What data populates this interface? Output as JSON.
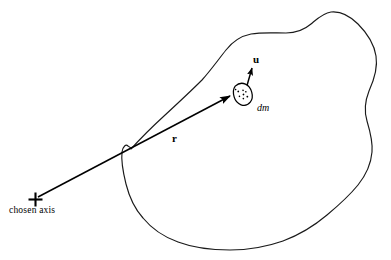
{
  "figure": {
    "kind": "physics-diagram",
    "background_color": "#ffffff",
    "stroke_color": "#1a1a1a",
    "vector_color": "#000000"
  },
  "labels": {
    "chosen_axis": "chosen axis",
    "r_vector": "r",
    "u_vector": "u",
    "mass_element": "dm"
  },
  "geometry": {
    "axis_marker": {
      "x": 35,
      "y": 199
    },
    "mass_element": {
      "x": 243,
      "y": 94,
      "rx": 9,
      "ry": 11,
      "rotation": -28
    },
    "r_vector": {
      "x1": 37,
      "y1": 197,
      "x2": 232,
      "y2": 96
    },
    "u_vector": {
      "x1": 247,
      "y1": 88,
      "x2": 252,
      "y2": 66
    },
    "body_outline_points": "131,149 150,128 175,105 200,80 218,58 232,44 248,36 266,33 286,33 305,27 322,14 340,12 355,20 367,34 375,52 377,72 370,92 366,112 371,130 372,150 365,170 352,186 336,203 317,220 295,234 270,244 244,249 218,249 194,245 172,236 155,223 142,207 133,190 126,174 122,161"
  },
  "mass_element_dots": [
    {
      "cx": -3.0,
      "cy": -4.5,
      "r": 0.9
    },
    {
      "cx": 1.8,
      "cy": -3.2,
      "r": 0.8
    },
    {
      "cx": -4.2,
      "cy": 0.4,
      "r": 0.8
    },
    {
      "cx": 0.2,
      "cy": 0.6,
      "r": 0.9
    },
    {
      "cx": 3.6,
      "cy": -0.6,
      "r": 0.8
    },
    {
      "cx": -1.8,
      "cy": 4.2,
      "r": 0.8
    },
    {
      "cx": 2.6,
      "cy": 4.4,
      "r": 0.9
    },
    {
      "cx": -4.4,
      "cy": -7.4,
      "r": 0.8
    }
  ]
}
